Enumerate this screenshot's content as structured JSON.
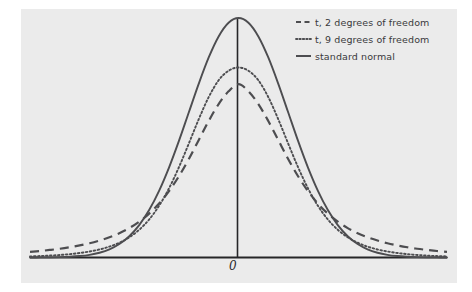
{
  "figure": {
    "background_color": "#ffffff",
    "panel_color": "#ebebeb",
    "axis_color": "#262628",
    "curve_color": "#4d4d50"
  },
  "axis": {
    "origin_label": "0"
  },
  "legend": {
    "entries": [
      {
        "label": "t, 2 degrees of freedom",
        "style": "dashed",
        "marker": "dashed-line-icon"
      },
      {
        "label": "t, 9 degrees of freedom",
        "style": "dotted",
        "marker": "dotted-line-icon"
      },
      {
        "label": "standard normal",
        "style": "solid",
        "marker": "solid-line-icon"
      }
    ]
  },
  "chart_data": {
    "type": "line",
    "title": "",
    "subtitle": "",
    "xlabel": "",
    "ylabel": "",
    "xlim": [
      -4.2,
      4.2
    ],
    "ylim": [
      0,
      0.42
    ],
    "grid": false,
    "legend_position": "top-right",
    "annotations": [
      {
        "text": "0",
        "x": 0,
        "y": 0,
        "placement": "below-axis",
        "style": "italic"
      }
    ],
    "x": [
      -4.2,
      -4.0,
      -3.8,
      -3.6,
      -3.4,
      -3.2,
      -3.0,
      -2.8,
      -2.6,
      -2.4,
      -2.2,
      -2.0,
      -1.8,
      -1.6,
      -1.4,
      -1.2,
      -1.0,
      -0.8,
      -0.6,
      -0.4,
      -0.2,
      0.0,
      0.2,
      0.4,
      0.6,
      0.8,
      1.0,
      1.2,
      1.4,
      1.6,
      1.8,
      2.0,
      2.2,
      2.4,
      2.6,
      2.8,
      3.0,
      3.2,
      3.4,
      3.6,
      3.8,
      4.0,
      4.2
    ],
    "series": [
      {
        "name": "t, 2 degrees of freedom",
        "style": "dashed",
        "values": [
          0.0094,
          0.0108,
          0.0126,
          0.0146,
          0.0171,
          0.0201,
          0.0237,
          0.0282,
          0.0337,
          0.0405,
          0.049,
          0.0597,
          0.0731,
          0.0898,
          0.1105,
          0.1354,
          0.1642,
          0.1958,
          0.2274,
          0.2556,
          0.2768,
          0.2887,
          0.2768,
          0.2556,
          0.2274,
          0.1958,
          0.1642,
          0.1354,
          0.1105,
          0.0898,
          0.0731,
          0.0597,
          0.049,
          0.0405,
          0.0337,
          0.0282,
          0.0237,
          0.0201,
          0.0171,
          0.0146,
          0.0126,
          0.0108,
          0.0094
        ]
      },
      {
        "name": "t, 9 degrees of freedom",
        "style": "dotted",
        "values": [
          0.0018,
          0.0024,
          0.0032,
          0.0042,
          0.0056,
          0.0075,
          0.01,
          0.0134,
          0.0181,
          0.0246,
          0.0337,
          0.0462,
          0.0633,
          0.0861,
          0.1152,
          0.1504,
          0.19,
          0.2305,
          0.2672,
          0.2952,
          0.3111,
          0.3165,
          0.3111,
          0.2952,
          0.2672,
          0.2305,
          0.19,
          0.1504,
          0.1152,
          0.0861,
          0.0633,
          0.0462,
          0.0337,
          0.0246,
          0.0181,
          0.0134,
          0.01,
          0.0075,
          0.0056,
          0.0042,
          0.0032,
          0.0024,
          0.0018
        ]
      },
      {
        "name": "standard normal",
        "style": "solid",
        "values": [
          6e-05,
          0.00013,
          0.00029,
          0.00061,
          0.00123,
          0.00238,
          0.00443,
          0.00792,
          0.01358,
          0.02239,
          0.03547,
          0.05399,
          0.07895,
          0.11092,
          0.14973,
          0.19419,
          0.24197,
          0.28969,
          0.33322,
          0.36827,
          0.39104,
          0.39894,
          0.39104,
          0.36827,
          0.33322,
          0.28969,
          0.24197,
          0.19419,
          0.14973,
          0.11092,
          0.07895,
          0.05399,
          0.03547,
          0.02239,
          0.01358,
          0.00792,
          0.00443,
          0.00238,
          0.00123,
          0.00061,
          0.00029,
          0.00013,
          6e-05
        ]
      }
    ]
  }
}
